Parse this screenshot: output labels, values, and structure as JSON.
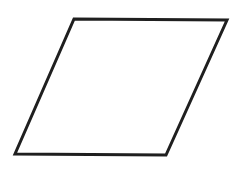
{
  "canvas": {
    "width": 238,
    "height": 178,
    "background_color": "#ffffff"
  },
  "figure": {
    "name": "parallelogram",
    "shape_type": "parallelogram",
    "fill": "none",
    "fill_color": "#ffffff",
    "stroke_color": "#1f1f1f",
    "stroke_width": 3,
    "vertices": [
      {
        "label": "top-left",
        "x": 74,
        "y": 19
      },
      {
        "label": "top-right",
        "x": 227,
        "y": 20
      },
      {
        "label": "bottom-right",
        "x": 166,
        "y": 155
      },
      {
        "label": "bottom-left",
        "x": 15,
        "y": 154
      }
    ],
    "points_attr": "74,19 227,20 166,155 15,154",
    "edges": [
      {
        "name": "top-edge",
        "from": "top-left",
        "to": "top-right"
      },
      {
        "name": "right-edge",
        "from": "top-right",
        "to": "bottom-right"
      },
      {
        "name": "bottom-edge",
        "from": "bottom-right",
        "to": "bottom-left"
      },
      {
        "name": "left-edge",
        "from": "bottom-left",
        "to": "top-left"
      }
    ]
  }
}
